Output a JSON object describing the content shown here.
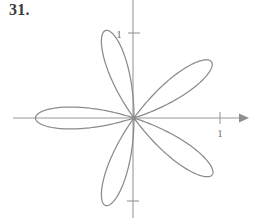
{
  "problem": {
    "number_label": "31."
  },
  "figure": {
    "name": "polar-rose-curve",
    "stroke_color": "#8b8b8b",
    "axis_color": "#9a9a9a",
    "background": "#ffffff",
    "origin": {
      "x": 134,
      "y": 118
    },
    "unit_px": 86,
    "x_axis": {
      "start_x": 13,
      "end_x": 247,
      "y": 118,
      "has_arrow_right": true
    },
    "y_axis": {
      "x": 133,
      "start_y": 0,
      "end_y": 218,
      "has_arrow": false
    },
    "ticks": [
      {
        "name": "y-tick-1",
        "axis": "y",
        "value": "1",
        "label": "1",
        "px": {
          "x": 133,
          "y": 33
        },
        "label_pos": {
          "x": 120,
          "y": 37
        }
      },
      {
        "name": "x-tick-1",
        "axis": "x",
        "value": "1",
        "label": "1",
        "px": {
          "x": 220,
          "y": 118
        },
        "label_pos": {
          "x": 217,
          "y": 135
        }
      },
      {
        "name": "y-tick-neg1",
        "axis": "y",
        "value": "",
        "label": "",
        "px": {
          "x": 133,
          "y": 201
        },
        "label_pos": {
          "x": 0,
          "y": 0
        }
      }
    ]
  },
  "chart_data": {
    "type": "line",
    "plot_kind": "polar-rose",
    "title": "",
    "equation": "r = cos(5θ)",
    "petal_count": 5,
    "petal_angular_spacing_deg": 72,
    "max_radius": 1.07,
    "xlabel": "",
    "ylabel": "",
    "xlim": [
      -1.4,
      1.32
    ],
    "ylim": [
      -1.16,
      1.37
    ],
    "grid": false,
    "legend": null,
    "xticks": [
      1
    ],
    "xticklabels": [
      "1"
    ],
    "yticks": [
      1
    ],
    "yticklabels": [
      "1"
    ],
    "petal_tip_angles_deg": [
      180,
      108,
      36,
      -36,
      -108
    ],
    "petal_tips_px": [
      {
        "angle_deg": 180,
        "x": 42,
        "y": 118
      },
      {
        "angle_deg": 108,
        "x": 105,
        "y": 38
      },
      {
        "angle_deg": 36,
        "x": 204,
        "y": 70
      },
      {
        "angle_deg": -36,
        "x": 205,
        "y": 168
      },
      {
        "angle_deg": -108,
        "x": 110,
        "y": 201
      }
    ]
  }
}
